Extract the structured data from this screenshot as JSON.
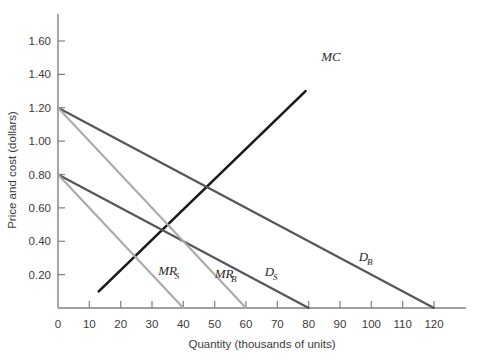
{
  "chart_data": {
    "type": "line",
    "title": "",
    "xlabel": "Quantity (thousands of units)",
    "ylabel": "Price and cost (dollars)",
    "xlim": [
      0,
      132
    ],
    "ylim": [
      0,
      1.7
    ],
    "xticks": [
      0,
      10,
      20,
      30,
      40,
      50,
      60,
      70,
      80,
      90,
      100,
      110,
      120
    ],
    "xtick_labels": [
      "0",
      "10",
      "20",
      "30",
      "40",
      "50",
      "60",
      "70",
      "80",
      "90",
      "100",
      "110",
      "120"
    ],
    "yticks": [
      0.2,
      0.4,
      0.6,
      0.8,
      1.0,
      1.2,
      1.4,
      1.6
    ],
    "ytick_labels": [
      "0.20",
      "0.40",
      "0.60",
      "0.80",
      "1.00",
      "1.20",
      "1.40",
      "1.60"
    ],
    "grid": false,
    "legend": "inline-labels",
    "series": [
      {
        "name": "MC",
        "label": "MC",
        "label_sub": "",
        "color": "#1a1a1a",
        "width": 2.6,
        "points": [
          [
            13,
            0.1
          ],
          [
            79,
            1.3
          ]
        ],
        "label_x": 84,
        "label_y": 1.48
      },
      {
        "name": "D_B",
        "label": "D",
        "label_sub": "B",
        "color": "#555555",
        "width": 2.1,
        "points": [
          [
            0,
            1.2
          ],
          [
            120,
            0.0
          ]
        ],
        "label_x": 96,
        "label_y": 0.28
      },
      {
        "name": "D_S",
        "label": "D",
        "label_sub": "S",
        "color": "#555555",
        "width": 2.1,
        "points": [
          [
            0,
            0.8
          ],
          [
            80,
            0.0
          ]
        ],
        "label_x": 66,
        "label_y": 0.19
      },
      {
        "name": "MR_B",
        "label": "MR",
        "label_sub": "B",
        "color": "#aaaaaa",
        "width": 2.1,
        "points": [
          [
            0,
            1.2
          ],
          [
            60,
            0.0
          ]
        ],
        "label_x": 50,
        "label_y": 0.18
      },
      {
        "name": "MR_S",
        "label": "MR",
        "label_sub": "S",
        "color": "#aaaaaa",
        "width": 2.1,
        "points": [
          [
            0,
            0.8
          ],
          [
            40,
            0.0
          ]
        ],
        "label_x": 32,
        "label_y": 0.2
      }
    ],
    "axis_color": "#808080"
  }
}
